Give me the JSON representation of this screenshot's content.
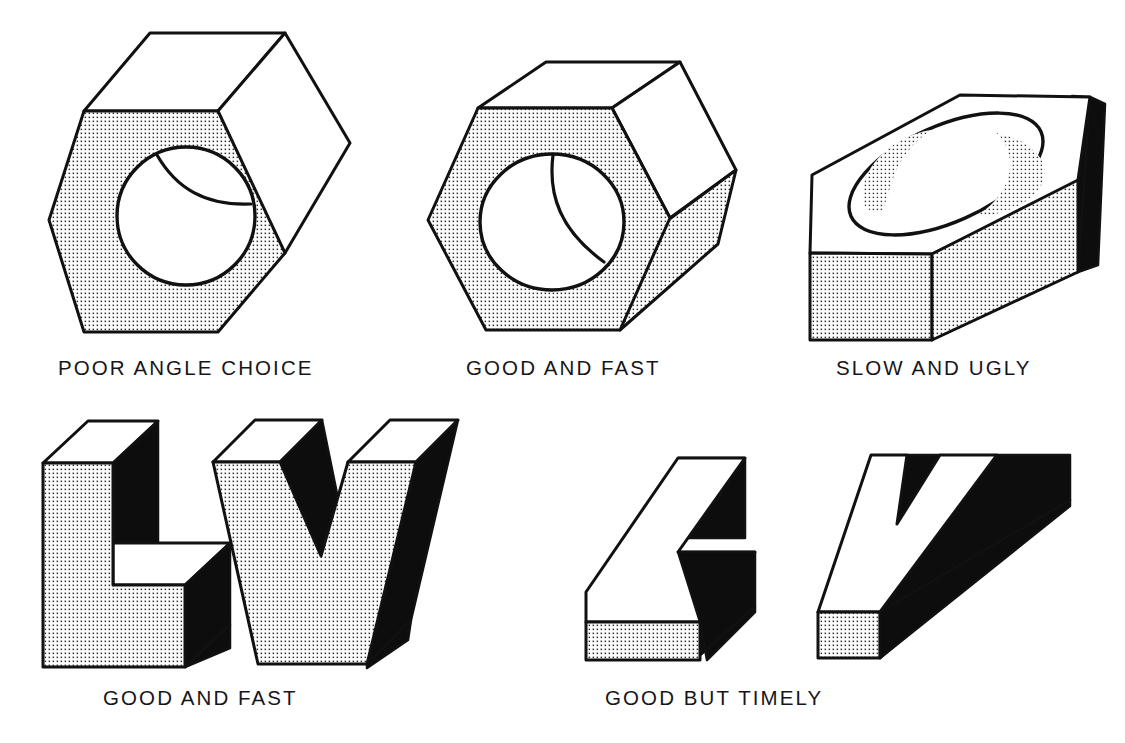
{
  "figure": {
    "background_color": "#ffffff",
    "line_color": "#111111",
    "stipple_color": "#2a2a2a",
    "solid_face_color": "#0d0d0d",
    "light_face_color": "#ffffff"
  },
  "captions": [
    {
      "id": "cap-0",
      "text": "POOR ANGLE CHOICE",
      "row": 1,
      "column": 1
    },
    {
      "id": "cap-1",
      "text": "GOOD AND FAST",
      "row": 1,
      "column": 2
    },
    {
      "id": "cap-2",
      "text": "SLOW AND UGLY",
      "row": 1,
      "column": 3
    },
    {
      "id": "cap-3",
      "text": "GOOD AND FAST",
      "row": 2,
      "column": 1
    },
    {
      "id": "cap-4",
      "text": "GOOD BUT TIMELY",
      "row": 2,
      "column": 2
    }
  ],
  "objects": [
    {
      "name": "hex-nut-poor-angle",
      "description": "Hexagonal nut with through hole, viewed nearly face-on so the hexagon reads flat",
      "caption": "POOR ANGLE CHOICE",
      "faces": {
        "front": "stipple",
        "top": "white",
        "side": "white"
      },
      "feature": "round through hole with visible bore arc"
    },
    {
      "name": "hex-nut-good-and-fast",
      "description": "Hexagonal nut with through hole at a correct isometric viewing angle",
      "caption": "GOOD AND FAST",
      "faces": {
        "front": "stipple",
        "top": "white",
        "side": "white",
        "lower_right": "stipple"
      },
      "feature": "round through hole with visible bore arc"
    },
    {
      "name": "hex-block-slow-and-ugly",
      "description": "Flattened hexagonal block viewed from a low angle with an elliptical hole",
      "caption": "SLOW AND UGLY",
      "faces": {
        "top": "white",
        "front": "stipple",
        "right": "stipple",
        "far_right": "black"
      },
      "feature": "elliptical counterbored hole"
    },
    {
      "name": "letter-l-good-and-fast",
      "description": "Extruded capital letter L at a good isometric angle",
      "caption": "GOOD AND FAST",
      "faces": {
        "front": "stipple",
        "side": "black",
        "top": "white"
      }
    },
    {
      "name": "letter-v-good-and-fast",
      "description": "Extruded capital letter V at a good isometric angle",
      "caption": "GOOD AND FAST",
      "faces": {
        "front": "stipple",
        "side": "black",
        "top": "white"
      }
    },
    {
      "name": "letter-l-good-but-timely",
      "description": "Extruded capital letter L seen from a high angle showing mostly the top face",
      "caption": "GOOD BUT TIMELY",
      "faces": {
        "top": "white",
        "side": "black",
        "front": "stipple"
      }
    },
    {
      "name": "letter-v-good-but-timely",
      "description": "Extruded capital letter V seen from a high angle showing mostly the top face",
      "caption": "GOOD BUT TIMELY",
      "faces": {
        "top": "white",
        "side": "black",
        "front": "stipple"
      }
    }
  ]
}
